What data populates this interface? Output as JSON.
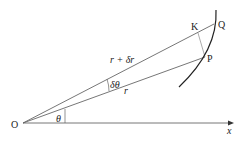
{
  "diagram": {
    "type": "polar-coordinates-increment",
    "points": {
      "O": {
        "label": "O",
        "x": 23,
        "y": 123
      },
      "P": {
        "label": "P",
        "x": 205,
        "y": 57
      },
      "Q": {
        "label": "Q",
        "x": 214,
        "y": 24
      },
      "K": {
        "label": "K",
        "x": 196,
        "y": 30
      }
    },
    "labels": {
      "origin": "O",
      "point_p": "P",
      "point_q": "Q",
      "point_k": "K",
      "radius_oq": "r + δr",
      "radius_op": "r",
      "angle_small": "δθ",
      "angle_theta": "θ",
      "x_axis": "x"
    },
    "colors": {
      "line": "#555555",
      "curve": "#222222",
      "text": "#222222",
      "background": "#ffffff"
    }
  }
}
